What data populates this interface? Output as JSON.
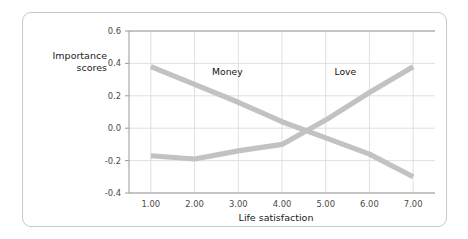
{
  "chart_data": {
    "type": "line",
    "title": "",
    "xlabel": "Life satisfaction",
    "ylabel": "Importance scores",
    "ylabel_line1": "Importance",
    "ylabel_line2": "scores",
    "x": [
      1,
      2,
      3,
      4,
      5,
      6,
      7
    ],
    "xtick_labels": [
      "1.00",
      "2.00",
      "3.00",
      "4.00",
      "5.00",
      "6.00",
      "7.00"
    ],
    "ytick_labels": [
      "0.6",
      "0.4",
      "0.2",
      "0.0",
      "-0.2",
      "-0.4"
    ],
    "ytick_values": [
      0.6,
      0.4,
      0.2,
      0.0,
      -0.2,
      -0.4
    ],
    "xlim": [
      0.5,
      7.5
    ],
    "ylim": [
      -0.4,
      0.6
    ],
    "grid": true,
    "legend_position": "inline-annotation",
    "series": [
      {
        "name": "Money",
        "label": "Money",
        "color": "#c2c2c2",
        "values": [
          0.38,
          0.27,
          0.16,
          0.04,
          -0.06,
          -0.16,
          -0.3
        ]
      },
      {
        "name": "Love",
        "label": "Love",
        "color": "#c2c2c2",
        "values": [
          -0.17,
          -0.19,
          -0.14,
          -0.1,
          0.05,
          0.22,
          0.38
        ]
      }
    ],
    "annotations": [
      {
        "text": "Money",
        "x": 2.75,
        "y": 0.33
      },
      {
        "text": "Love",
        "x": 5.45,
        "y": 0.33
      }
    ]
  },
  "style": {
    "grid_color": "#dcdcdc",
    "axis_color": "#9a9a9a",
    "card_border_color": "#c9c9c9",
    "background": "#ffffff",
    "text_color": "#1b1b1b",
    "tick_color": "#4a4a4a"
  }
}
